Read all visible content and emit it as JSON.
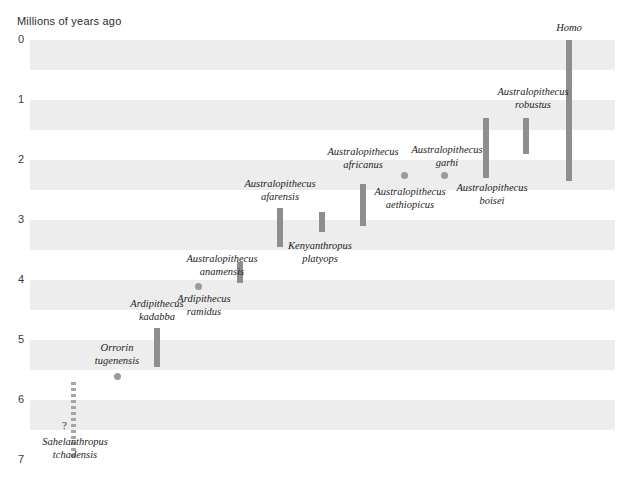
{
  "axis": {
    "title": "Millions of years ago",
    "ticks": [
      "0",
      "1",
      "2",
      "3",
      "4",
      "5",
      "6",
      "7"
    ],
    "unknown_marker": "?"
  },
  "chart_data": {
    "type": "bar",
    "orientation": "vertical-ranges",
    "title": "Millions of years ago",
    "xlabel": "",
    "ylabel": "Millions of years ago",
    "ylim": [
      0,
      7
    ],
    "y_inverted": true,
    "grid": "alternating-horizontal-bands",
    "legend": "none",
    "bar_color": "#8e8e8e",
    "dot_color": "#9a9a9a",
    "band_color": "#ededed",
    "taxa": [
      {
        "name": "Sahelanthropus tchadensis",
        "lines": [
          "Sahelanthropus",
          "tchadensis"
        ],
        "marker": "dashed-range",
        "start_mya": 7.0,
        "end_mya": 5.7,
        "x_px": 74,
        "label_x_px": 75,
        "label_y_px": 436,
        "note": "?"
      },
      {
        "name": "Orrorin tugenensis",
        "lines": [
          "Orrorin",
          "tugenensis"
        ],
        "marker": "point",
        "point_mya": 5.6,
        "x_px": 117,
        "label_x_px": 117,
        "label_y_px": 342
      },
      {
        "name": "Ardipithecus kadabba",
        "lines": [
          "Ardipithecus",
          "kadabba"
        ],
        "marker": "range",
        "start_mya": 5.45,
        "end_mya": 4.8,
        "x_px": 157,
        "label_x_px": 157,
        "label_y_px": 298
      },
      {
        "name": "Ardipithecus ramidus",
        "lines": [
          "Ardipithecus",
          "ramidus"
        ],
        "marker": "point",
        "point_mya": 4.1,
        "x_px": 198,
        "label_x_px": 204,
        "label_y_px": 293
      },
      {
        "name": "Australopithecus anamensis",
        "lines": [
          "Australopithecus",
          "anamensis"
        ],
        "marker": "range",
        "start_mya": 4.05,
        "end_mya": 3.7,
        "x_px": 240,
        "label_x_px": 222,
        "label_y_px": 253
      },
      {
        "name": "Australopithecus afarensis",
        "lines": [
          "Australopithecus",
          "afarensis"
        ],
        "marker": "range",
        "start_mya": 3.45,
        "end_mya": 2.8,
        "x_px": 280,
        "label_x_px": 280,
        "label_y_px": 178
      },
      {
        "name": "Kenyanthropus platyops",
        "lines": [
          "Kenyanthropus",
          "platyops"
        ],
        "marker": "range",
        "start_mya": 3.2,
        "end_mya": 2.87,
        "x_px": 322,
        "label_x_px": 320,
        "label_y_px": 240
      },
      {
        "name": "Australopithecus africanus",
        "lines": [
          "Australopithecus",
          "africanus"
        ],
        "marker": "range",
        "start_mya": 3.1,
        "end_mya": 2.4,
        "x_px": 363,
        "label_x_px": 363,
        "label_y_px": 146
      },
      {
        "name": "Australopithecus aethiopicus",
        "lines": [
          "Australopithecus",
          "aethiopicus"
        ],
        "marker": "point",
        "point_mya": 2.25,
        "x_px": 404,
        "label_x_px": 410,
        "label_y_px": 186
      },
      {
        "name": "Australopithecus garhi",
        "lines": [
          "Australopithecus",
          "garhi"
        ],
        "marker": "point",
        "point_mya": 2.25,
        "x_px": 444,
        "label_x_px": 447,
        "label_y_px": 144
      },
      {
        "name": "Australopithecus boisei",
        "lines": [
          "Australopithecus",
          "boisei"
        ],
        "marker": "range",
        "start_mya": 2.3,
        "end_mya": 1.3,
        "x_px": 486,
        "label_x_px": 492,
        "label_y_px": 182
      },
      {
        "name": "Australopithecus robustus",
        "lines": [
          "Australopithecus",
          "robustus"
        ],
        "marker": "range",
        "start_mya": 1.9,
        "end_mya": 1.3,
        "x_px": 526,
        "label_x_px": 533,
        "label_y_px": 86
      },
      {
        "name": "Homo",
        "lines": [
          "Homo"
        ],
        "marker": "range",
        "start_mya": 2.35,
        "end_mya": 0.0,
        "x_px": 569,
        "label_x_px": 569,
        "label_y_px": 22
      }
    ]
  }
}
